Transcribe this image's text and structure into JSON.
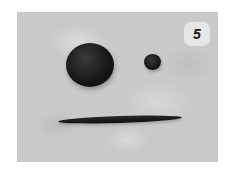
{
  "image": {
    "description": "Photo of dark clay pieces on a gray textured surface: one large ball, one small ball, and a long thin rolled snake",
    "step_badge": "5",
    "colors": {
      "background": "#c9c9c9",
      "clay": "#141414",
      "badge": "#ebebeb"
    },
    "objects": [
      {
        "name": "large-clay-ball"
      },
      {
        "name": "small-clay-ball"
      },
      {
        "name": "clay-snake"
      }
    ]
  }
}
